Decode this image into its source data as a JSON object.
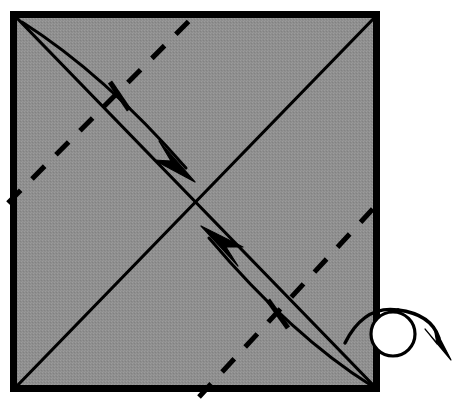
{
  "figure": {
    "kind": "origami-diagram",
    "title": "Origami step: fold two opposite corners to the center, then turn the model over",
    "canvas": {
      "width": 458,
      "height": 414,
      "background": "#ffffff"
    }
  },
  "colors": {
    "paper_fill": "#8e8e8e",
    "paper_fill_light": "#9a9a9a",
    "ink": "#000000",
    "border": "#000000",
    "turn_over_circle_fill": "#ffffff",
    "page_background": "#ffffff"
  },
  "paper": {
    "label": "square sheet of paper",
    "corners": {
      "top_left": [
        10,
        11
      ],
      "top_right": [
        380,
        11
      ],
      "bottom_right": [
        380,
        392
      ],
      "bottom_left": [
        10,
        392
      ]
    },
    "border_width": 7,
    "fill": "#8e8e8e"
  },
  "creases": {
    "existing_folds_label": "existing diagonal creases (mountain / already folded)",
    "solid_lines": [
      {
        "name": "diagonal-top-left-to-bottom-right",
        "from": [
          13,
          14
        ],
        "to": [
          378,
          390
        ],
        "stroke_width": 3.2,
        "style": "solid"
      },
      {
        "name": "diagonal-bottom-left-to-top-right",
        "from": [
          14,
          389
        ],
        "to": [
          378,
          14
        ],
        "stroke_width": 3.2,
        "style": "solid"
      }
    ],
    "new_folds_label": "new valley folds (dashed)",
    "dashed_lines": [
      {
        "name": "valley-fold-upper-left",
        "from": [
          8,
          203
        ],
        "to": [
          199,
          11
        ],
        "stroke_width": 5,
        "style": "dashed",
        "dash_pattern": "18 16"
      },
      {
        "name": "valley-fold-lower-right",
        "from": [
          199,
          397
        ],
        "to": [
          382,
          199
        ],
        "stroke_width": 5,
        "style": "dashed",
        "dash_pattern": "18 16"
      }
    ]
  },
  "fold_arrows": [
    {
      "name": "fold-arrow-top-left-corner-to-center",
      "description": "curved arrow bringing the top-left corner down to the center",
      "start": [
        22,
        22
      ],
      "control": [
        96,
        78
      ],
      "tip": [
        196,
        201
      ],
      "curve": "M 22 22 Q 104 74 186 168",
      "head_tip": [
        194,
        180
      ],
      "stroke_width": 3,
      "head_style": "solid-filled-concave",
      "tick": {
        "name": "landmark-tick-upper",
        "from": [
          110,
          82
        ],
        "to": [
          129,
          110
        ],
        "stroke_width": 5
      }
    },
    {
      "name": "fold-arrow-bottom-right-corner-to-center",
      "description": "curved arrow bringing the bottom-right corner up to the center",
      "start": [
        372,
        386
      ],
      "control": [
        300,
        330
      ],
      "tip": [
        200,
        206
      ],
      "curve": "M 372 386 Q 292 336 209 238",
      "head_tip": [
        202,
        226
      ],
      "stroke_width": 3,
      "head_style": "solid-filled-concave",
      "tick": {
        "name": "landmark-tick-lower",
        "from": [
          268,
          300
        ],
        "to": [
          288,
          328
        ],
        "stroke_width": 5
      }
    }
  ],
  "turn_over_symbol": {
    "name": "turn-over-symbol",
    "description": "loop arrow around the right edge meaning: turn the model over",
    "circle": {
      "center": [
        393,
        334
      ],
      "radius": 22,
      "stroke_width": 3.2,
      "fill": "#ffffff"
    },
    "arc_path": "M 346 342 Q 366 304 402 310 Q 434 316 440 340",
    "arrow_tip": [
      449,
      356
    ],
    "stroke_width": 3.2
  },
  "labels": {
    "step_caption": "",
    "figure_number": ""
  }
}
